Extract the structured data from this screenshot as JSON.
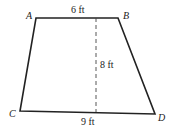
{
  "figure": {
    "shape": "trapezoid",
    "vertices": {
      "A": {
        "label": "A",
        "x": 36,
        "y": 18
      },
      "B": {
        "label": "B",
        "x": 118,
        "y": 18
      },
      "C": {
        "label": "C",
        "x": 20,
        "y": 111
      },
      "D": {
        "label": "D",
        "x": 155,
        "y": 114
      }
    },
    "measurements": {
      "top": "6 ft",
      "height": "8 ft",
      "bottom": "9 ft"
    },
    "colors": {
      "stroke": "#222222",
      "background": "#ffffff"
    }
  }
}
